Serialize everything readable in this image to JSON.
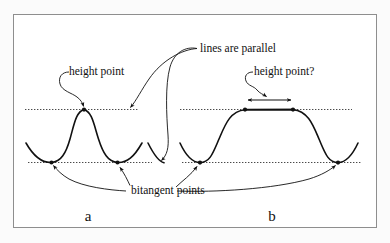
{
  "figure": {
    "kind": "geometry-diagram",
    "background_color": "#ffffff",
    "page_color": "#fbfbfb",
    "frame_border_color": "#8e8e8e",
    "ink_color": "#111111",
    "dotted_line_color": "#4a4a4a",
    "annotations": {
      "height_point_left": "height point",
      "lines_are_parallel": "lines are parallel",
      "height_point_right": "height point?",
      "bitangent_points": "bitangent points"
    },
    "panel_labels": {
      "left": "a",
      "right": "b"
    },
    "left_panel": {
      "description": "smooth single-bump curve; horizontal dotted tangent line at the apex (height point) and a lower horizontal dotted bitangent line touching the two valleys",
      "height_point_marker_count": 1,
      "bitangent_point_marker_count": 2,
      "apex_dotted_line_y": 108,
      "bitangent_dotted_line_y": 161
    },
    "right_panel": {
      "description": "plateau-topped curve; the dotted tangent line coincides with the flat top so the height point is an entire segment, marked by a double-headed arrow between the two plateau ends; lower dotted bitangent line touches the two valleys",
      "height_point_marker_count": 2,
      "bitangent_point_marker_count": 2,
      "apex_dotted_line_y": 108,
      "bitangent_dotted_line_y": 161,
      "double_arrow_label": "height point?"
    }
  }
}
